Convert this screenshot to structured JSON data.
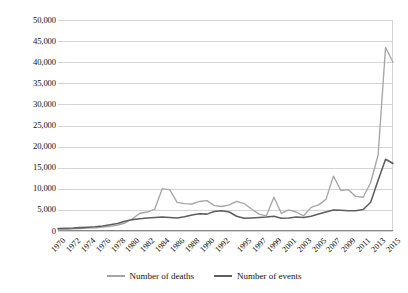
{
  "chart": {
    "type": "line",
    "title": "",
    "xlabel": "",
    "ylabel": ""
  },
  "axes": {
    "y_ticks": [
      "50,000",
      "45,000",
      "40,000",
      "35,000",
      "30,000",
      "25,000",
      "20,000",
      "15,000",
      "10,000",
      "5,000",
      "0"
    ],
    "x_ticks": [
      "1970",
      "1972",
      "1974",
      "1976",
      "1978",
      "1980",
      "1982",
      "1984",
      "1986",
      "1988",
      "1990",
      "1992",
      "1995",
      "1997",
      "1999",
      "2001",
      "2003",
      "2005",
      "2007",
      "2009",
      "2011",
      "2013",
      "2015"
    ]
  },
  "legend": {
    "position": "bottom",
    "items": [
      {
        "label": "Number of deaths",
        "color": "#a6a6a6",
        "key": "deaths"
      },
      {
        "label": "Number of events",
        "color": "#5e5e5e",
        "key": "events"
      }
    ]
  },
  "chart_data": {
    "type": "line",
    "title": "",
    "xlabel": "",
    "ylabel": "",
    "ylim": [
      0,
      50000
    ],
    "ytick_step": 5000,
    "grid": true,
    "legend_position": "bottom",
    "x": [
      1970,
      1971,
      1972,
      1973,
      1974,
      1975,
      1976,
      1977,
      1978,
      1979,
      1980,
      1981,
      1982,
      1983,
      1984,
      1985,
      1986,
      1987,
      1988,
      1989,
      1990,
      1991,
      1992,
      1993,
      1994,
      1995,
      1996,
      1997,
      1998,
      1999,
      2000,
      2001,
      2002,
      2003,
      2004,
      2005,
      2006,
      2007,
      2008,
      2009,
      2010,
      2011,
      2012,
      2013,
      2014,
      2015
    ],
    "series": [
      {
        "name": "Number of deaths",
        "color": "#a6a6a6",
        "values": [
          300,
          350,
          500,
          600,
          700,
          750,
          900,
          1100,
          1400,
          1900,
          2900,
          4200,
          4500,
          5200,
          10000,
          9800,
          6800,
          6500,
          6400,
          7000,
          7200,
          6000,
          5800,
          6200,
          7000,
          6500,
          5200,
          4000,
          3600,
          8000,
          4200,
          5000,
          4500,
          3600,
          5600,
          6200,
          7500,
          13000,
          9600,
          9800,
          8200,
          8000,
          11500,
          18000,
          43500,
          40000
        ]
      },
      {
        "name": "Number of events",
        "color": "#5e5e5e",
        "values": [
          600,
          650,
          700,
          800,
          900,
          1000,
          1200,
          1500,
          1800,
          2300,
          2700,
          2900,
          3100,
          3200,
          3300,
          3200,
          3100,
          3400,
          3800,
          4100,
          4000,
          4600,
          4800,
          4500,
          3500,
          3000,
          3100,
          3200,
          3300,
          3500,
          3000,
          3100,
          3300,
          3200,
          3500,
          4000,
          4500,
          5000,
          4900,
          4800,
          4800,
          5100,
          6800,
          12000,
          17000,
          16000
        ]
      }
    ],
    "annotations": [
      {
        "text": "Sharp spike in both series in 2014",
        "year": 2014
      }
    ]
  }
}
